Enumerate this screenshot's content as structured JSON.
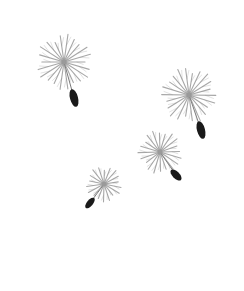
{
  "scene": {
    "description": "Four dandelion seeds floating on a white background",
    "background": "#ffffff",
    "pappus_color": "#8a8a8a",
    "seed_color": "#1a1a1a",
    "seeds": [
      {
        "name": "seed-1",
        "cx": 64,
        "cy": 62,
        "r": 28,
        "rays": 22,
        "stem_x": 74,
        "stem_y": 98,
        "body_rx": 4,
        "body_ry": 9,
        "body_angle": -15
      },
      {
        "name": "seed-2",
        "cx": 189,
        "cy": 95,
        "r": 28,
        "rays": 22,
        "stem_x": 201,
        "stem_y": 130,
        "body_rx": 4,
        "body_ry": 9,
        "body_angle": -15
      },
      {
        "name": "seed-3",
        "cx": 160,
        "cy": 152,
        "r": 22,
        "rays": 20,
        "stem_x": 176,
        "stem_y": 175,
        "body_rx": 3.5,
        "body_ry": 7,
        "body_angle": -45
      },
      {
        "name": "seed-4",
        "cx": 104,
        "cy": 184,
        "r": 18,
        "rays": 18,
        "stem_x": 90,
        "stem_y": 203,
        "body_rx": 3,
        "body_ry": 6.5,
        "body_angle": 40
      }
    ]
  }
}
